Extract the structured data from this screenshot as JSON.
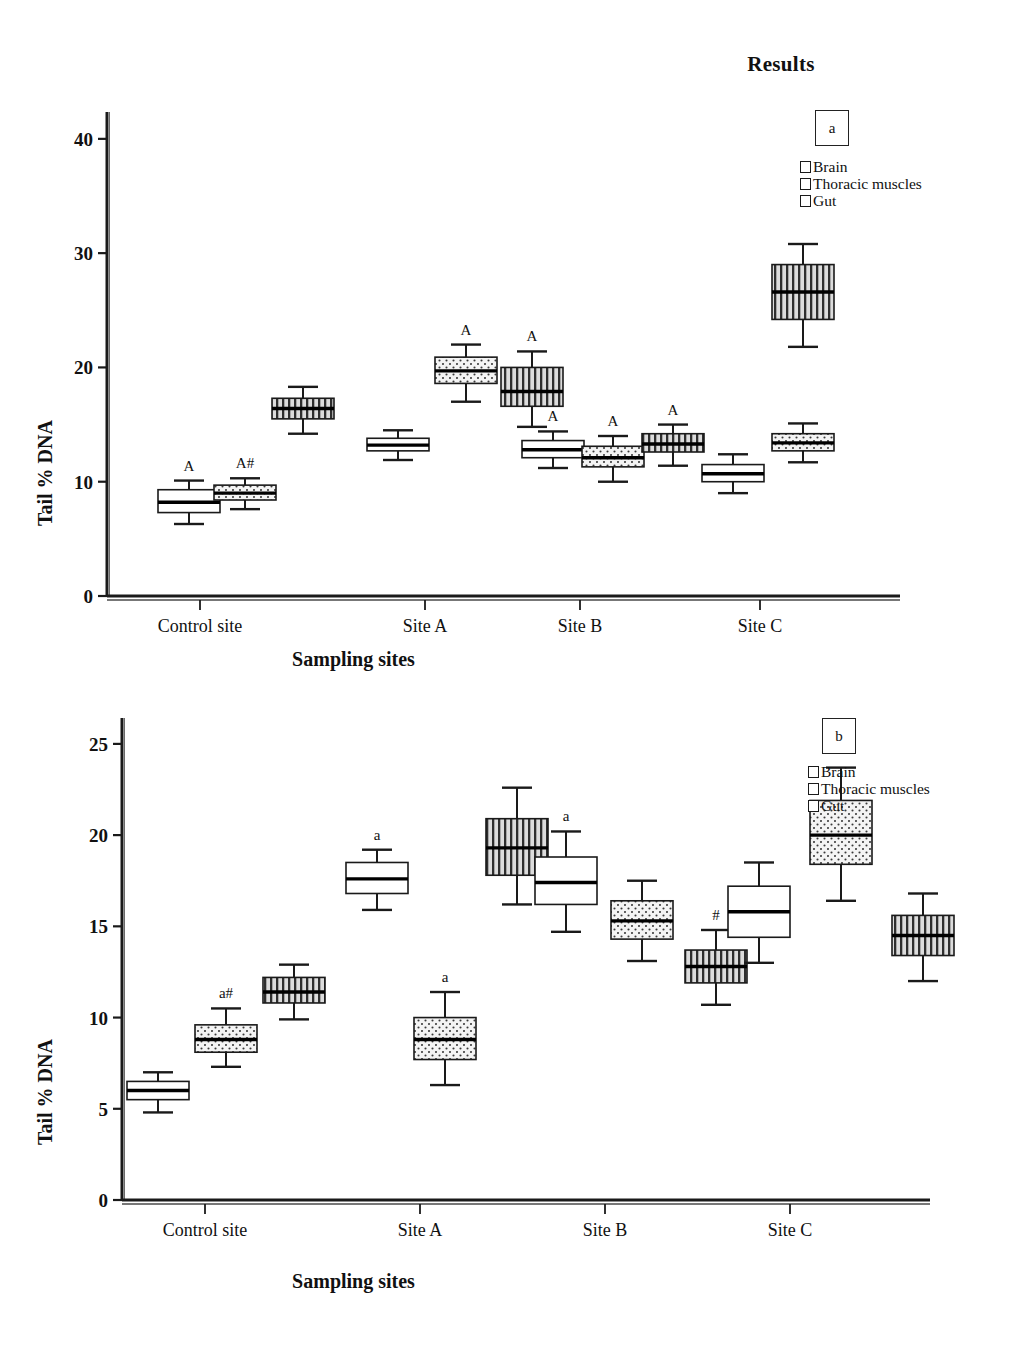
{
  "header": {
    "title": "Results"
  },
  "legend": {
    "items": [
      {
        "label": "Brain",
        "pattern": "solid-white"
      },
      {
        "label": "Thoracic muscles",
        "pattern": "dotted"
      },
      {
        "label": "Gut",
        "pattern": "vertical-stripes"
      }
    ]
  },
  "panels": {
    "a": {
      "tag": "a"
    },
    "b": {
      "tag": "b"
    }
  },
  "chart_data": [
    {
      "type": "box",
      "panel": "a",
      "title": "",
      "xlabel": "Sampling sites",
      "ylabel": "Tail % DNA",
      "ylim": [
        0,
        42
      ],
      "yticks": [
        0,
        10,
        20,
        30,
        40
      ],
      "ytick_labels": [
        "0",
        "10",
        "20",
        "30",
        "40"
      ],
      "categories": [
        "Control site",
        "Site A",
        "Site B",
        "Site C"
      ],
      "grid": false,
      "legend_position": "top-right",
      "series": [
        {
          "name": "Brain",
          "pattern": "solid-white",
          "boxes": [
            {
              "category": "Control site",
              "whisker_low": 6.3,
              "q1": 7.3,
              "median": 8.2,
              "q3": 9.3,
              "whisker_high": 10.1,
              "annotation": "A"
            },
            {
              "category": "Site A",
              "whisker_low": 11.9,
              "q1": 12.7,
              "median": 13.2,
              "q3": 13.8,
              "whisker_high": 14.5,
              "annotation": ""
            },
            {
              "category": "Site B",
              "whisker_low": 11.2,
              "q1": 12.1,
              "median": 12.8,
              "q3": 13.6,
              "whisker_high": 14.4,
              "annotation": "A"
            },
            {
              "category": "Site C",
              "whisker_low": 9.0,
              "q1": 10.0,
              "median": 10.7,
              "q3": 11.5,
              "whisker_high": 12.4,
              "annotation": ""
            }
          ]
        },
        {
          "name": "Thoracic muscles",
          "pattern": "dotted",
          "boxes": [
            {
              "category": "Control site",
              "whisker_low": 7.6,
              "q1": 8.4,
              "median": 9.0,
              "q3": 9.7,
              "whisker_high": 10.3,
              "annotation": "A#"
            },
            {
              "category": "Site A",
              "whisker_low": 17.0,
              "q1": 18.6,
              "median": 19.7,
              "q3": 20.9,
              "whisker_high": 22.0,
              "annotation": "A"
            },
            {
              "category": "Site B",
              "whisker_low": 10.0,
              "q1": 11.3,
              "median": 12.1,
              "q3": 13.1,
              "whisker_high": 14.0,
              "annotation": "A"
            },
            {
              "category": "Site C",
              "whisker_low": 11.7,
              "q1": 12.7,
              "median": 13.4,
              "q3": 14.2,
              "whisker_high": 15.1,
              "annotation": ""
            }
          ]
        },
        {
          "name": "Gut",
          "pattern": "vertical-stripes",
          "boxes": [
            {
              "category": "Control site",
              "whisker_low": 14.2,
              "q1": 15.5,
              "median": 16.4,
              "q3": 17.3,
              "whisker_high": 18.3,
              "annotation": ""
            },
            {
              "category": "Site A",
              "whisker_low": 14.8,
              "q1": 16.6,
              "median": 17.9,
              "q3": 20.0,
              "whisker_high": 21.4,
              "annotation": "A"
            },
            {
              "category": "Site B",
              "whisker_low": 11.4,
              "q1": 12.6,
              "median": 13.3,
              "q3": 14.2,
              "whisker_high": 15.0,
              "annotation": "A"
            },
            {
              "category": "Site C",
              "whisker_low": 21.8,
              "q1": 24.2,
              "median": 26.6,
              "q3": 29.0,
              "whisker_high": 30.8,
              "annotation": ""
            }
          ]
        }
      ]
    },
    {
      "type": "box",
      "panel": "b",
      "title": "",
      "xlabel": "Sampling sites",
      "ylabel": "Tail % DNA",
      "ylim": [
        0,
        26.2
      ],
      "yticks": [
        0,
        5,
        10,
        15,
        20,
        25
      ],
      "ytick_labels": [
        "0",
        "5",
        "10",
        "15",
        "20",
        "25"
      ],
      "categories": [
        "Control site",
        "Site A",
        "Site B",
        "Site C"
      ],
      "grid": false,
      "legend_position": "top-right",
      "series": [
        {
          "name": "Brain",
          "pattern": "solid-white",
          "boxes": [
            {
              "category": "Control site",
              "whisker_low": 4.8,
              "q1": 5.5,
              "median": 6.0,
              "q3": 6.5,
              "whisker_high": 7.0,
              "annotation": ""
            },
            {
              "category": "Site A",
              "whisker_low": 15.9,
              "q1": 16.8,
              "median": 17.6,
              "q3": 18.5,
              "whisker_high": 19.2,
              "annotation": "a"
            },
            {
              "category": "Site B",
              "whisker_low": 14.7,
              "q1": 16.2,
              "median": 17.4,
              "q3": 18.8,
              "whisker_high": 20.2,
              "annotation": "a"
            },
            {
              "category": "Site C",
              "whisker_low": 13.0,
              "q1": 14.4,
              "median": 15.8,
              "q3": 17.2,
              "whisker_high": 18.5,
              "annotation": ""
            }
          ]
        },
        {
          "name": "Thoracic muscles",
          "pattern": "dotted",
          "boxes": [
            {
              "category": "Control site",
              "whisker_low": 7.3,
              "q1": 8.1,
              "median": 8.8,
              "q3": 9.6,
              "whisker_high": 10.5,
              "annotation": "a#"
            },
            {
              "category": "Site A",
              "whisker_low": 6.3,
              "q1": 7.7,
              "median": 8.8,
              "q3": 10.0,
              "whisker_high": 11.4,
              "annotation": "a"
            },
            {
              "category": "Site B",
              "whisker_low": 13.1,
              "q1": 14.3,
              "median": 15.3,
              "q3": 16.4,
              "whisker_high": 17.5,
              "annotation": ""
            },
            {
              "category": "Site C",
              "whisker_low": 16.4,
              "q1": 18.4,
              "median": 20.0,
              "q3": 21.9,
              "whisker_high": 23.7,
              "annotation": ""
            }
          ]
        },
        {
          "name": "Gut",
          "pattern": "vertical-stripes",
          "boxes": [
            {
              "category": "Control site",
              "whisker_low": 9.9,
              "q1": 10.8,
              "median": 11.4,
              "q3": 12.2,
              "whisker_high": 12.9,
              "annotation": ""
            },
            {
              "category": "Site A",
              "whisker_low": 16.2,
              "q1": 17.8,
              "median": 19.3,
              "q3": 20.9,
              "whisker_high": 22.6,
              "annotation": ""
            },
            {
              "category": "Site B",
              "whisker_low": 10.7,
              "q1": 11.9,
              "median": 12.8,
              "q3": 13.7,
              "whisker_high": 14.8,
              "annotation": "#"
            },
            {
              "category": "Site C",
              "whisker_low": 12.0,
              "q1": 13.4,
              "median": 14.5,
              "q3": 15.6,
              "whisker_high": 16.8,
              "annotation": ""
            }
          ]
        }
      ]
    }
  ]
}
